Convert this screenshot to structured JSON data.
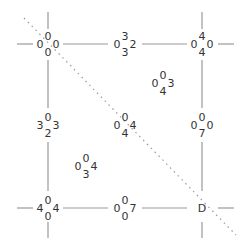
{
  "diagram": {
    "type": "grid-graph",
    "colors": {
      "line": "#999999",
      "text": "#333333",
      "background": "#ffffff"
    },
    "nodes": [
      {
        "id": "n00",
        "top": "0",
        "left": "0",
        "right": "0",
        "bottom": "0",
        "x": 48,
        "y": 44
      },
      {
        "id": "n01",
        "top": "3",
        "left": "0",
        "right": "2",
        "bottom": "3",
        "x": 125,
        "y": 44
      },
      {
        "id": "n02",
        "top": "4",
        "left": "0",
        "right": "0",
        "bottom": "4",
        "x": 202,
        "y": 44
      },
      {
        "id": "n10",
        "top": "0",
        "left": "3",
        "right": "3",
        "bottom": "2",
        "x": 48,
        "y": 125
      },
      {
        "id": "n11",
        "top": "0",
        "left": "0",
        "right": "4",
        "bottom": "4",
        "x": 125,
        "y": 125
      },
      {
        "id": "n12",
        "top": "0",
        "left": "0",
        "right": "0",
        "bottom": "7",
        "x": 202,
        "y": 125
      },
      {
        "id": "n20",
        "top": "0",
        "left": "4",
        "right": "4",
        "bottom": "0",
        "x": 48,
        "y": 208
      },
      {
        "id": "n21",
        "top": "0",
        "left": "0",
        "right": "7",
        "bottom": "0",
        "x": 125,
        "y": 208
      },
      {
        "id": "n22",
        "label": "D",
        "x": 202,
        "y": 208
      }
    ],
    "cells": [
      {
        "id": "c0",
        "top": "0",
        "left": "0",
        "right": "3",
        "bottom": "4",
        "x": 163,
        "y": 83
      },
      {
        "id": "c1",
        "top": "0",
        "left": "0",
        "right": "4",
        "bottom": "3",
        "x": 86,
        "y": 166
      }
    ]
  }
}
